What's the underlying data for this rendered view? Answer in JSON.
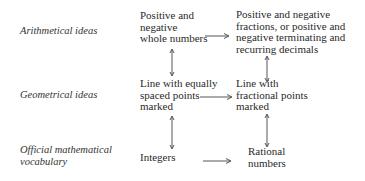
{
  "rows": [
    {
      "label": [
        "Arithmetical ideas"
      ],
      "left": [
        "Positive and",
        "negative",
        "whole numbers"
      ],
      "right": [
        "Positive and negative",
        "fractions, or positive and",
        "negative terminating and",
        "recurring decimals"
      ]
    },
    {
      "label": [
        "Geometrical ideas"
      ],
      "left": [
        "Line with equally",
        "spaced points",
        "marked"
      ],
      "right": [
        "Line with",
        "fractional points",
        "marked"
      ]
    },
    {
      "label": [
        "Official mathematical",
        "vocabulary"
      ],
      "left": [
        "Integers"
      ],
      "right": [
        "Rational",
        "numbers"
      ]
    }
  ],
  "arrows": {
    "horizontal": [
      "row0-left-to-right",
      "row1-left-to-right",
      "row2-left-to-right"
    ],
    "vertical_double": [
      "left-col-row0-row1",
      "left-col-row1-row2",
      "right-col-row0-row1",
      "right-col-row1-row2"
    ]
  },
  "colors": {
    "text": "#2a2a2a",
    "arrow": "#444444",
    "background": "#ffffff"
  }
}
